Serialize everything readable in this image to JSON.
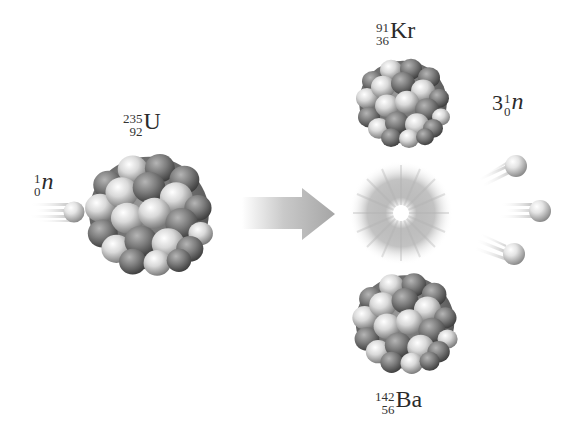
{
  "diagram": {
    "type": "nuclear-fission",
    "reactants": {
      "neutron": {
        "mass_number": "1",
        "atomic_number": "0",
        "symbol": "n"
      },
      "target": {
        "mass_number": "235",
        "atomic_number": "92",
        "symbol": "U"
      }
    },
    "arrow": {
      "direction": "right"
    },
    "products": {
      "fragment_top": {
        "mass_number": "91",
        "atomic_number": "36",
        "symbol": "Kr"
      },
      "fragment_bottom": {
        "mass_number": "142",
        "atomic_number": "56",
        "symbol": "Ba"
      },
      "neutrons": {
        "coefficient": "3",
        "mass_number": "1",
        "atomic_number": "0",
        "symbol": "n",
        "count": 3
      }
    },
    "energy_burst": {
      "label": ""
    },
    "colors": {
      "background": "#ffffff",
      "nucleon_light": "#e6e6e6",
      "nucleon_dark": "#6a6a6a",
      "arrow": "#a8a8a8",
      "text": "#2b2b2b"
    }
  }
}
